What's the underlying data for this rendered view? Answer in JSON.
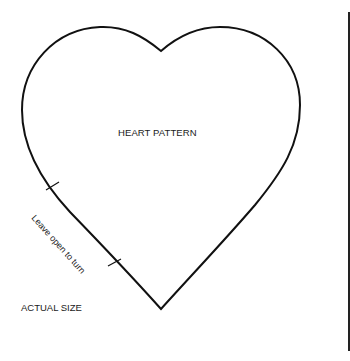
{
  "pattern": {
    "title": "HEART PATTERN",
    "opening_note": "Leave open to turn",
    "scale_note": "ACTUAL SIZE"
  },
  "colors": {
    "outline": "#111111",
    "background": "#ffffff",
    "text": "#1a1a1a"
  }
}
